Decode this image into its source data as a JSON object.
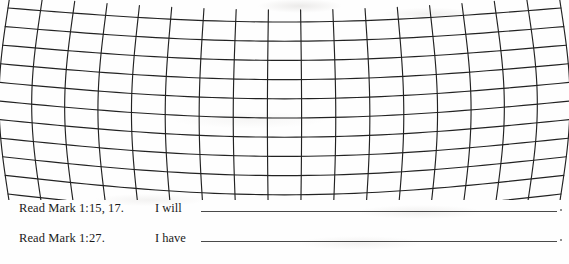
{
  "page": {
    "kind": "scanned-workbook-page",
    "background_color": "#fefefe",
    "ink_color": "#1a1a1a"
  },
  "figure": {
    "name": "distorted-grid-mesh",
    "line_color": "#222222",
    "vertical_line_count": 18,
    "horizontal_line_count": 11,
    "bounds": {
      "x": 8,
      "y": 8,
      "width": 553,
      "height": 186
    },
    "top_curve_sag": 14,
    "bottom_curve_sag": 20,
    "side_bow": 9
  },
  "exercise": {
    "rows": [
      {
        "reference": "Read Mark 1:15, 17.",
        "stem": "I will",
        "answer": "",
        "answer_placeholder": ""
      },
      {
        "reference": "Read Mark 1:27.",
        "stem": "I have",
        "answer": "",
        "answer_placeholder": ""
      }
    ]
  }
}
